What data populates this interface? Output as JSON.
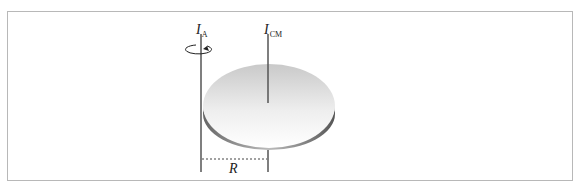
{
  "diagram": {
    "axis_a": {
      "symbol": "I",
      "subscript": "A"
    },
    "axis_cm": {
      "symbol": "I",
      "subscript": "CM"
    },
    "distance_label": "R",
    "icons": {
      "rotation": "rotation-arrow-icon"
    }
  }
}
